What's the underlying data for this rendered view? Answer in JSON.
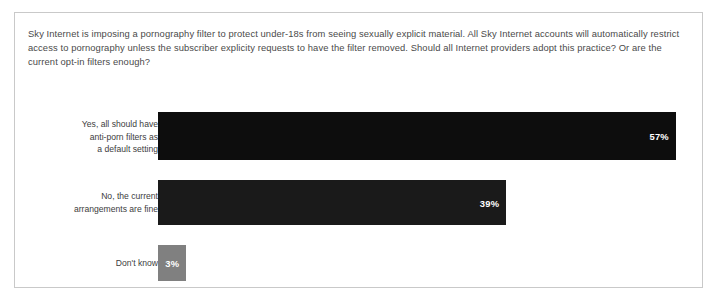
{
  "card": {
    "question": "Sky Internet is imposing a pornography filter to protect under-18s from seeing sexually explicit material. All Sky Internet accounts will automatically restrict access to pornography unless the subscriber explicity requests to have the filter removed. Should all Internet providers adopt this practice? Or are the current opt-in filters enough?"
  },
  "chart_data": {
    "type": "bar",
    "orientation": "horizontal",
    "title": "Sky Internet is imposing a pornography filter to protect under-18s from seeing sexually explicit material. All Sky Internet accounts will automatically restrict access to pornography unless the subscriber explicity requests to have the filter removed. Should all Internet providers adopt this practice? Or are the current opt-in filters enough?",
    "xlabel": "",
    "ylabel": "",
    "xlim": [
      0,
      100
    ],
    "grid": false,
    "legend": "none",
    "categories": [
      "Yes, all should have anti-porn filters as a default setting",
      "No, the current arrangements are fine",
      "Don't know"
    ],
    "values": [
      57,
      39,
      3
    ],
    "value_labels": [
      "57%",
      "39%",
      "3%"
    ],
    "colors": [
      "#0d0d0d",
      "#1a1a1a",
      "#808080"
    ],
    "bars": [
      {
        "label_lines": [
          "Yes, all should have",
          "anti-porn filters as",
          "a default setting"
        ],
        "value": 57,
        "value_label": "57%",
        "color": "#0d0d0d",
        "width_pct": 95.2
      },
      {
        "label_lines": [
          "No, the current",
          "arrangements are fine"
        ],
        "value": 39,
        "value_label": "39%",
        "color": "#1a1a1a",
        "width_pct": 64.0
      },
      {
        "label_lines": [
          "Don't know"
        ],
        "value": 3,
        "value_label": "3%",
        "color": "#808080",
        "width_pct": 5.2
      }
    ]
  },
  "style": {
    "card_border": "#c9c9c9",
    "text_color": "#4a4a4a",
    "label_color": "#3d3d3d",
    "value_color": "#ffffff",
    "background": "#ffffff"
  }
}
